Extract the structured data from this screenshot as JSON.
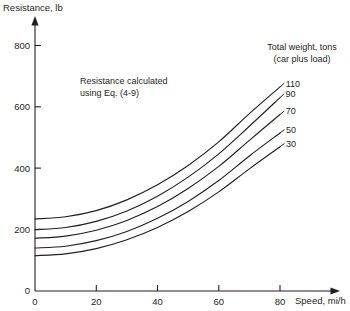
{
  "chart_data": {
    "type": "line",
    "title": "",
    "xlabel": "Speed, mi/h",
    "ylabel": "Resistance, lb",
    "xlim": [
      0,
      80
    ],
    "ylim": [
      0,
      800
    ],
    "xticks": [
      0,
      20,
      40,
      60,
      80
    ],
    "yticks": [
      0,
      200,
      400,
      600,
      800
    ],
    "grid": false,
    "legend_position": "right-inline-end-labels",
    "legend_title_line1": "Total weight, tons",
    "legend_title_line2": "(car plus load)",
    "annotation_line1": "Resistance calculated",
    "annotation_line2": "using Eq. (4-9)",
    "x": [
      0,
      10,
      20,
      30,
      40,
      50,
      60,
      70,
      80
    ],
    "series": [
      {
        "name": "110",
        "label": "110",
        "values": [
          235,
          242,
          262,
          297,
          346,
          409,
          486,
          578,
          665
        ]
      },
      {
        "name": "90",
        "label": "90",
        "values": [
          200,
          207,
          227,
          261,
          309,
          371,
          447,
          537,
          630
        ]
      },
      {
        "name": "70",
        "label": "70",
        "values": [
          172,
          179,
          198,
          230,
          275,
          334,
          406,
          491,
          575
        ]
      },
      {
        "name": "50",
        "label": "50",
        "values": [
          140,
          146,
          164,
          194,
          237,
          292,
          360,
          440,
          515
        ]
      },
      {
        "name": "30",
        "label": "30",
        "values": [
          115,
          121,
          138,
          167,
          207,
          259,
          323,
          398,
          470
        ]
      }
    ]
  },
  "axes": {
    "y_axis_title": "Resistance, lb",
    "x_axis_title": "Speed, mi/h",
    "y_tick_labels": [
      "800",
      "600",
      "400",
      "200",
      "0"
    ],
    "x_tick_labels": [
      "0",
      "20",
      "40",
      "60",
      "80"
    ]
  },
  "annotation": {
    "line1": "Resistance calculated",
    "line2": "using Eq. (4-9)"
  },
  "legend": {
    "title_line1": "Total weight, tons",
    "title_line2": "(car plus load)",
    "labels": [
      "110",
      "90",
      "70",
      "50",
      "30"
    ]
  },
  "colors": {
    "ink": "#231f20",
    "background": "#ffffff"
  }
}
